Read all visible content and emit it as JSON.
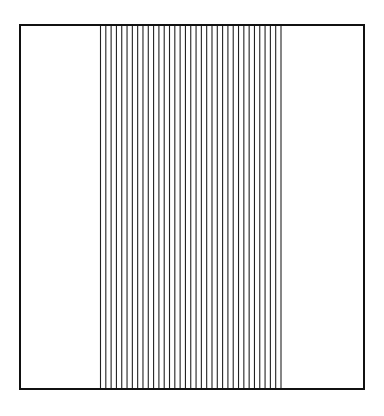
{
  "figure": {
    "frame": {
      "x": 20,
      "y": 25,
      "width": 344,
      "height": 364,
      "stroke": "#111111",
      "stroke_width": 2
    },
    "lines": {
      "count": 35,
      "x_start": 100.5,
      "x_end": 281,
      "stroke": "#222222",
      "stroke_width": 1.1
    }
  }
}
